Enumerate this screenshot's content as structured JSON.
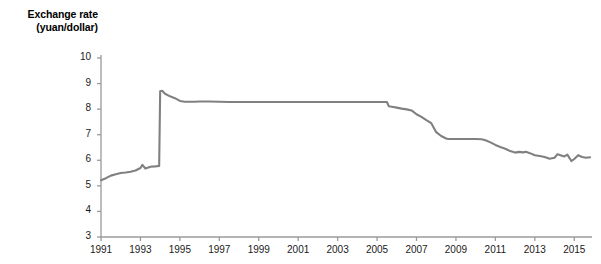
{
  "chart_data": {
    "type": "line",
    "title": "Exchange rate (yuan/dollar)",
    "title_lines": [
      "Exchange rate",
      "(yuan/dollar)"
    ],
    "xlabel": "",
    "ylabel": "Exchange rate (yuan/dollar)",
    "xlim": [
      1991,
      2015.9
    ],
    "ylim": [
      3,
      10
    ],
    "grid": false,
    "legend": false,
    "line_color": "#808080",
    "axis_color": "#9a9a9a",
    "text_color": "#1a1a1a",
    "ytick_labels": [
      "10",
      "9",
      "8",
      "7",
      "6",
      "5",
      "4",
      "3"
    ],
    "ytick_values": [
      10,
      9,
      8,
      7,
      6,
      5,
      4,
      3
    ],
    "xtick_labels": [
      "1991",
      "1993",
      "1995",
      "1997",
      "1999",
      "2001",
      "2003",
      "2005",
      "2007",
      "2009",
      "2011",
      "2013",
      "2015"
    ],
    "xtick_values": [
      1991,
      1993,
      1995,
      1997,
      1999,
      2001,
      2003,
      2005,
      2007,
      2009,
      2011,
      2013,
      2015
    ],
    "series": [
      {
        "name": "Yuan per US dollar",
        "x": [
          1991.0,
          1991.25,
          1991.5,
          1991.75,
          1992.0,
          1992.25,
          1992.5,
          1992.75,
          1993.0,
          1993.1,
          1993.25,
          1993.4,
          1993.5,
          1993.75,
          1993.95,
          1994.0,
          1994.1,
          1994.25,
          1994.5,
          1994.75,
          1995.0,
          1995.25,
          1995.5,
          1995.75,
          1996.0,
          1996.5,
          1997.0,
          1997.5,
          1998.0,
          1999.0,
          2000.0,
          2001.0,
          2002.0,
          2003.0,
          2004.0,
          2005.0,
          2005.5,
          2005.6,
          2005.75,
          2006.0,
          2006.25,
          2006.5,
          2006.75,
          2007.0,
          2007.25,
          2007.5,
          2007.75,
          2008.0,
          2008.25,
          2008.5,
          2008.6,
          2008.75,
          2009.0,
          2009.5,
          2010.0,
          2010.3,
          2010.5,
          2010.75,
          2011.0,
          2011.25,
          2011.5,
          2011.75,
          2012.0,
          2012.2,
          2012.4,
          2012.55,
          2012.75,
          2013.0,
          2013.25,
          2013.5,
          2013.75,
          2014.0,
          2014.15,
          2014.3,
          2014.5,
          2014.65,
          2014.85,
          2015.0,
          2015.2,
          2015.4,
          2015.6,
          2015.8
        ],
        "y": [
          5.22,
          5.3,
          5.4,
          5.45,
          5.5,
          5.52,
          5.55,
          5.6,
          5.7,
          5.82,
          5.68,
          5.72,
          5.75,
          5.76,
          5.78,
          8.7,
          8.72,
          8.6,
          8.5,
          8.43,
          8.32,
          8.29,
          8.29,
          8.29,
          8.3,
          8.3,
          8.29,
          8.28,
          8.28,
          8.28,
          8.28,
          8.28,
          8.28,
          8.28,
          8.28,
          8.28,
          8.28,
          8.11,
          8.09,
          8.06,
          8.02,
          7.99,
          7.95,
          7.8,
          7.7,
          7.57,
          7.45,
          7.1,
          6.95,
          6.85,
          6.83,
          6.83,
          6.83,
          6.83,
          6.83,
          6.82,
          6.78,
          6.7,
          6.6,
          6.52,
          6.45,
          6.36,
          6.3,
          6.33,
          6.31,
          6.33,
          6.28,
          6.2,
          6.17,
          6.13,
          6.06,
          6.1,
          6.24,
          6.2,
          6.15,
          6.22,
          5.97,
          6.05,
          6.2,
          6.13,
          6.1,
          6.12
        ]
      }
    ]
  }
}
